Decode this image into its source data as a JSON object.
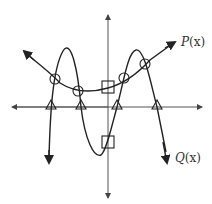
{
  "diagram": {
    "title": "",
    "curves": [
      {
        "name": "P(x)",
        "var": "x",
        "description": "upward-opening parabola-like curve with arrows at both ends"
      },
      {
        "name": "Q(x)",
        "var": "x",
        "description": "quartic curve with two peaks and one trough, arrows pointing down at both ends"
      }
    ],
    "markers": {
      "triangles": "x-intercepts of Q(x)",
      "circles": "intersections of P(x) and Q(x)",
      "squares": "y-intercepts of P(x) and Q(x)"
    },
    "counts": {
      "triangles": 4,
      "circles": 4,
      "squares": 2
    },
    "colors": {
      "stroke": "#222222",
      "axis": "#555555",
      "background": "#ffffff"
    }
  },
  "labels": {
    "p_name": "P",
    "p_arg": "(x)",
    "q_name": "Q",
    "q_arg": "(x)"
  }
}
